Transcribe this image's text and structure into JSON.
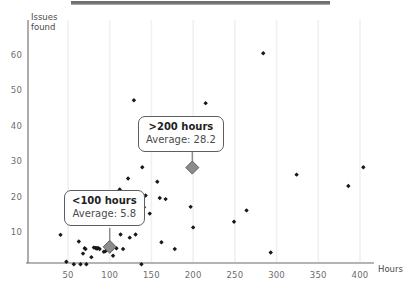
{
  "chart_data": {
    "type": "scatter",
    "title": "",
    "xlabel": "Hours",
    "ylabel": "Issues found",
    "xlim": [
      0,
      420
    ],
    "ylim": [
      0,
      65
    ],
    "xticks": [
      50,
      100,
      150,
      200,
      250,
      300,
      350,
      400
    ],
    "yticks": [
      10,
      20,
      30,
      40,
      50,
      60
    ],
    "grid": "vertical-light",
    "legend": "none",
    "series": [
      {
        "name": "Projects",
        "marker": "small-black-diamond",
        "color": "#1a1a1a",
        "points": [
          [
            41,
            9.2
          ],
          [
            48,
            1.6
          ],
          [
            57,
            0.9
          ],
          [
            63,
            7.3
          ],
          [
            65,
            0.9
          ],
          [
            68,
            3.9
          ],
          [
            70,
            5.4
          ],
          [
            71,
            5.2
          ],
          [
            72,
            0.9
          ],
          [
            78,
            2.9
          ],
          [
            81,
            5.6
          ],
          [
            83,
            5.5
          ],
          [
            84,
            5.4
          ],
          [
            85,
            5.3
          ],
          [
            86,
            5.5
          ],
          [
            88,
            5.2
          ],
          [
            93,
            4.4
          ],
          [
            95,
            4.6
          ],
          [
            104,
            3.3
          ],
          [
            108,
            5.4
          ],
          [
            112,
            22.0
          ],
          [
            113,
            9.3
          ],
          [
            116,
            5.2
          ],
          [
            122,
            25.1
          ],
          [
            124,
            8.4
          ],
          [
            129,
            47.2
          ],
          [
            131,
            9.3
          ],
          [
            138,
            0.9
          ],
          [
            139,
            28.3
          ],
          [
            141,
            17.0
          ],
          [
            143,
            20.3
          ],
          [
            148,
            15.2
          ],
          [
            157,
            24.2
          ],
          [
            160,
            19.6
          ],
          [
            162,
            7.1
          ],
          [
            167,
            19.3
          ],
          [
            178,
            5.2
          ],
          [
            197,
            17.1
          ],
          [
            200,
            11.3
          ],
          [
            215,
            46.4
          ],
          [
            249,
            12.9
          ],
          [
            264,
            16.1
          ],
          [
            284,
            60.5
          ],
          [
            293,
            4.2
          ],
          [
            324,
            26.2
          ],
          [
            386,
            23.0
          ],
          [
            404,
            28.3
          ]
        ]
      },
      {
        "name": "Group averages",
        "marker": "large-grey-diamond",
        "color": "#8c8c8c",
        "points": [
          [
            199,
            28.2
          ],
          [
            100,
            5.8
          ]
        ]
      }
    ],
    "annotations": [
      {
        "id": "over-200",
        "title": ">200 hours",
        "subtitle": "Average: 28.2",
        "value": 28.2,
        "anchor_point": [
          199,
          28.2
        ]
      },
      {
        "id": "under-100",
        "title": "<100 hours",
        "subtitle": "Average: 5.8",
        "value": 5.8,
        "anchor_point": [
          100,
          5.8
        ]
      }
    ]
  },
  "axes": {
    "y_label_line1": "Issues",
    "y_label_line2": "found",
    "x_label": "Hours",
    "y_tick_labels": [
      "60",
      "50",
      "40",
      "30",
      "20",
      "10"
    ],
    "x_tick_labels": [
      "50",
      "100",
      "150",
      "200",
      "250",
      "300",
      "350",
      "400"
    ]
  },
  "colors": {
    "point": "#1a1a1a",
    "average_marker": "#8c8c8c",
    "axis": "#6b6b6b",
    "gridline": "#f0f0f0",
    "callout_border": "#5e5e5e",
    "top_strip": "#6f6f6f"
  }
}
